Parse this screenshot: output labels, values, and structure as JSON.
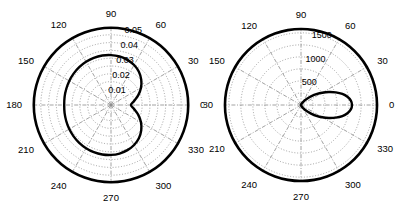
{
  "figure": {
    "type": "polar-pair",
    "background": "#ffffff",
    "line_color": "#000000",
    "grid_color": "#8a8a8a",
    "width": 408,
    "height": 209
  },
  "chart_data": [
    {
      "id": "left",
      "type": "line",
      "coordinate_system": "polar",
      "title": "",
      "xlabel": "",
      "ylabel": "",
      "grid": true,
      "legend": null,
      "angle_unit": "degrees",
      "angle_direction": "counterclockwise",
      "angle_zero_at": "east",
      "angular_ticks": [
        0,
        30,
        60,
        90,
        120,
        150,
        180,
        210,
        240,
        270,
        300,
        330
      ],
      "angular_tick_labels": [
        "0",
        "30",
        "60",
        "90",
        "120",
        "150",
        "180",
        "210",
        "240",
        "270",
        "300",
        "330"
      ],
      "radial_ticks": [
        0.01,
        0.02,
        0.03,
        0.04,
        0.05
      ],
      "radial_tick_labels": [
        "0.01",
        "0.02",
        "0.03",
        "0.04",
        "0.05"
      ],
      "radial_label_angle": 75,
      "rlim": [
        0,
        0.05
      ],
      "series": [
        {
          "name": "outer-boundary",
          "style": "thick-solid",
          "theta": [
            0,
            10,
            20,
            30,
            40,
            50,
            60,
            70,
            80,
            90,
            100,
            110,
            120,
            130,
            140,
            150,
            160,
            170,
            180,
            190,
            200,
            210,
            220,
            230,
            240,
            250,
            260,
            270,
            280,
            290,
            300,
            310,
            320,
            330,
            340,
            350
          ],
          "r": [
            0.0495,
            0.0495,
            0.0495,
            0.0495,
            0.0495,
            0.0495,
            0.0495,
            0.0495,
            0.0495,
            0.0495,
            0.0495,
            0.0495,
            0.0495,
            0.0495,
            0.0495,
            0.0495,
            0.0495,
            0.0495,
            0.0495,
            0.0495,
            0.0495,
            0.0495,
            0.0495,
            0.0495,
            0.0495,
            0.0495,
            0.0495,
            0.0495,
            0.0495,
            0.0495,
            0.0495,
            0.0495,
            0.0495,
            0.0495,
            0.0495,
            0.0495
          ]
        },
        {
          "name": "response-curve",
          "style": "thick-solid",
          "theta": [
            0,
            10,
            20,
            30,
            40,
            50,
            60,
            70,
            80,
            90,
            100,
            110,
            120,
            130,
            140,
            150,
            160,
            170,
            180,
            190,
            200,
            210,
            220,
            230,
            240,
            250,
            260,
            270,
            280,
            290,
            300,
            310,
            320,
            330,
            340,
            350
          ],
          "r": [
            0.0128,
            0.015,
            0.0186,
            0.0222,
            0.0253,
            0.0278,
            0.0296,
            0.0308,
            0.0316,
            0.032,
            0.0322,
            0.0322,
            0.032,
            0.0317,
            0.0313,
            0.0309,
            0.0305,
            0.0302,
            0.03,
            0.0302,
            0.0305,
            0.0309,
            0.0313,
            0.0317,
            0.032,
            0.0322,
            0.0322,
            0.032,
            0.0316,
            0.0308,
            0.0296,
            0.0278,
            0.0253,
            0.0222,
            0.0186,
            0.015
          ]
        }
      ]
    },
    {
      "id": "right",
      "type": "line",
      "coordinate_system": "polar",
      "title": "",
      "xlabel": "",
      "ylabel": "",
      "grid": true,
      "legend": null,
      "angle_unit": "degrees",
      "angle_direction": "counterclockwise",
      "angle_zero_at": "east",
      "angular_ticks": [
        0,
        30,
        60,
        90,
        120,
        150,
        180,
        210,
        240,
        270,
        300,
        330
      ],
      "angular_tick_labels": [
        "0",
        "30",
        "60",
        "90",
        "120",
        "150",
        "180",
        "210",
        "240",
        "270",
        "300",
        "330"
      ],
      "radial_ticks": [
        500,
        1000,
        1500
      ],
      "radial_tick_labels": [
        "500",
        "1000",
        "1500"
      ],
      "radial_label_angle": 75,
      "rlim": [
        0,
        1600
      ],
      "series": [
        {
          "name": "outer-boundary",
          "style": "thick-solid",
          "theta": [
            0,
            10,
            20,
            30,
            40,
            50,
            60,
            70,
            80,
            90,
            100,
            110,
            120,
            130,
            140,
            150,
            160,
            170,
            180,
            190,
            200,
            210,
            220,
            230,
            240,
            250,
            260,
            270,
            280,
            290,
            300,
            310,
            320,
            330,
            340,
            350
          ],
          "r": [
            1580,
            1580,
            1580,
            1580,
            1580,
            1580,
            1580,
            1580,
            1580,
            1580,
            1580,
            1580,
            1580,
            1580,
            1580,
            1580,
            1580,
            1580,
            1580,
            1580,
            1580,
            1580,
            1580,
            1580,
            1580,
            1580,
            1580,
            1580,
            1580,
            1580,
            1580,
            1580,
            1580,
            1580,
            1580,
            1580
          ]
        },
        {
          "name": "narrow-lobe",
          "style": "thick-solid",
          "theta": [
            0,
            5,
            10,
            15,
            20,
            25,
            30,
            35,
            40,
            45,
            50,
            55,
            60,
            65,
            70,
            75,
            80,
            85,
            90,
            180,
            270,
            275,
            280,
            285,
            290,
            295,
            300,
            305,
            310,
            315,
            320,
            325,
            330,
            335,
            340,
            345,
            350,
            355
          ],
          "r": [
            1060,
            1040,
            980,
            890,
            770,
            640,
            510,
            390,
            285,
            200,
            135,
            88,
            54,
            32,
            18,
            9,
            4,
            1,
            0,
            0,
            0,
            1,
            4,
            9,
            18,
            32,
            54,
            88,
            135,
            200,
            285,
            390,
            510,
            640,
            770,
            890,
            980,
            1040
          ]
        }
      ]
    }
  ]
}
